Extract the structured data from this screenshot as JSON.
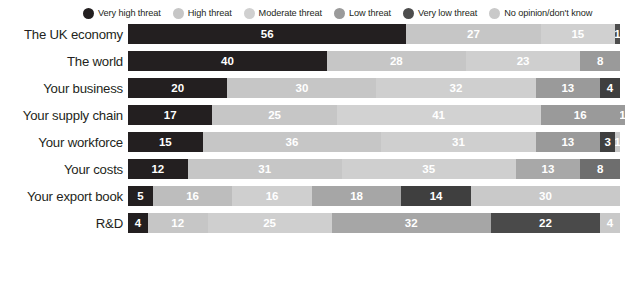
{
  "legend": {
    "items": [
      {
        "label": "Very high threat",
        "color": "#231f20",
        "swatch_icon": "legend-dot-icon"
      },
      {
        "label": "High threat",
        "color": "#c6c6c6",
        "swatch_icon": "legend-dot-icon"
      },
      {
        "label": "Moderate threat",
        "color": "#d0d0d0",
        "swatch_icon": "legend-dot-icon"
      },
      {
        "label": "Low threat",
        "color": "#9a9a9a",
        "swatch_icon": "legend-dot-icon"
      },
      {
        "label": "Very low threat",
        "color": "#4d4d4d",
        "swatch_icon": "legend-dot-icon"
      },
      {
        "label": "No opinion/don't know",
        "color": "#c9c9c9",
        "swatch_icon": "legend-dot-icon"
      }
    ]
  },
  "chart_data": {
    "type": "bar",
    "orientation": "horizontal",
    "stacked": true,
    "title": "",
    "subtitle": "",
    "xlabel": "",
    "ylabel": "",
    "xlim": [
      0,
      100
    ],
    "grid": false,
    "legend_position": "top",
    "value_suffix": "",
    "categories": [
      "The UK economy",
      "The world",
      "Your business",
      "Your supply chain",
      "Your workforce",
      "Your costs",
      "Your export book",
      "R&D"
    ],
    "series": [
      {
        "name": "Very high threat",
        "color": "#231f20",
        "label_color": "#ffffff",
        "values": [
          56,
          40,
          20,
          17,
          15,
          12,
          5,
          4
        ]
      },
      {
        "name": "High threat",
        "color": "#c6c6c6",
        "label_color": "#ffffff",
        "values": [
          27,
          28,
          30,
          25,
          36,
          31,
          16,
          12
        ]
      },
      {
        "name": "Moderate threat",
        "color": "#d0d0d0",
        "label_color": "#ffffff",
        "values": [
          15,
          23,
          32,
          41,
          31,
          35,
          16,
          25
        ]
      },
      {
        "name": "Low threat",
        "color": "#9a9a9a",
        "label_color": "#ffffff",
        "values": [
          1,
          8,
          13,
          16,
          13,
          13,
          18,
          32
        ]
      },
      {
        "name": "Very low threat",
        "color": "#4d4d4d",
        "label_color": "#ffffff",
        "values": [
          0,
          0,
          4,
          1,
          3,
          8,
          14,
          22
        ]
      },
      {
        "name": "No opinion/don't know",
        "color": "#c9c9c9",
        "label_color": "#ffffff",
        "values": [
          0,
          0,
          0,
          0,
          1,
          0,
          30,
          4
        ]
      }
    ],
    "rows": [
      {
        "category": "The UK economy",
        "segments": [
          {
            "series": "Very high threat",
            "value": 56,
            "label": "56",
            "color": "#231f20",
            "label_color": "#ffffff"
          },
          {
            "series": "High threat",
            "value": 27,
            "label": "27",
            "color": "#c6c6c6",
            "label_color": "#ffffff"
          },
          {
            "series": "Moderate threat",
            "value": 15,
            "label": "15",
            "color": "#d0d0d0",
            "label_color": "#ffffff"
          },
          {
            "series": "Low threat",
            "value": 1,
            "label": "1",
            "color": "#4d4d4d",
            "label_color": "#ffffff"
          }
        ]
      },
      {
        "category": "The world",
        "segments": [
          {
            "series": "Very high threat",
            "value": 40,
            "label": "40",
            "color": "#231f20",
            "label_color": "#ffffff"
          },
          {
            "series": "High threat",
            "value": 28,
            "label": "28",
            "color": "#c6c6c6",
            "label_color": "#ffffff"
          },
          {
            "series": "Moderate threat",
            "value": 23,
            "label": "23",
            "color": "#cfcfcf",
            "label_color": "#ffffff"
          },
          {
            "series": "Low threat",
            "value": 8,
            "label": "8",
            "color": "#9a9a9a",
            "label_color": "#ffffff"
          }
        ]
      },
      {
        "category": "Your business",
        "segments": [
          {
            "series": "Very high threat",
            "value": 20,
            "label": "20",
            "color": "#231f20",
            "label_color": "#ffffff"
          },
          {
            "series": "High threat",
            "value": 30,
            "label": "30",
            "color": "#c6c6c6",
            "label_color": "#ffffff"
          },
          {
            "series": "Moderate threat",
            "value": 32,
            "label": "32",
            "color": "#cfcfcf",
            "label_color": "#ffffff"
          },
          {
            "series": "Low threat",
            "value": 13,
            "label": "13",
            "color": "#9a9a9a",
            "label_color": "#ffffff"
          },
          {
            "series": "Very low threat",
            "value": 4,
            "label": "4",
            "color": "#3f3f3f",
            "label_color": "#ffffff"
          }
        ]
      },
      {
        "category": "Your supply chain",
        "segments": [
          {
            "series": "Very high threat",
            "value": 17,
            "label": "17",
            "color": "#231f20",
            "label_color": "#ffffff"
          },
          {
            "series": "High threat",
            "value": 25,
            "label": "25",
            "color": "#c6c6c6",
            "label_color": "#ffffff"
          },
          {
            "series": "Moderate threat",
            "value": 41,
            "label": "41",
            "color": "#d2d2d2",
            "label_color": "#ffffff"
          },
          {
            "series": "Low threat",
            "value": 16,
            "label": "16",
            "color": "#9a9a9a",
            "label_color": "#ffffff"
          },
          {
            "series": "Very low threat",
            "value": 1,
            "label": "1",
            "color": "#9a9a9a",
            "label_color": "#ffffff"
          }
        ]
      },
      {
        "category": "Your workforce",
        "segments": [
          {
            "series": "Very high threat",
            "value": 15,
            "label": "15",
            "color": "#231f20",
            "label_color": "#ffffff"
          },
          {
            "series": "High threat",
            "value": 36,
            "label": "36",
            "color": "#c6c6c6",
            "label_color": "#ffffff"
          },
          {
            "series": "Moderate threat",
            "value": 31,
            "label": "31",
            "color": "#cfcfcf",
            "label_color": "#ffffff"
          },
          {
            "series": "Low threat",
            "value": 13,
            "label": "13",
            "color": "#9a9a9a",
            "label_color": "#ffffff"
          },
          {
            "series": "Very low threat",
            "value": 3,
            "label": "3",
            "color": "#3f3f3f",
            "label_color": "#ffffff"
          },
          {
            "series": "No opinion/don't know",
            "value": 1,
            "label": "1",
            "color": "#c9c9c9",
            "label_color": "#ffffff"
          }
        ]
      },
      {
        "category": "Your costs",
        "segments": [
          {
            "series": "Very high threat",
            "value": 12,
            "label": "12",
            "color": "#231f20",
            "label_color": "#ffffff"
          },
          {
            "series": "High threat",
            "value": 31,
            "label": "31",
            "color": "#c6c6c6",
            "label_color": "#ffffff"
          },
          {
            "series": "Moderate threat",
            "value": 35,
            "label": "35",
            "color": "#cfcfcf",
            "label_color": "#ffffff"
          },
          {
            "series": "Low threat",
            "value": 13,
            "label": "13",
            "color": "#a8a8a8",
            "label_color": "#ffffff"
          },
          {
            "series": "Very low threat",
            "value": 8,
            "label": "8",
            "color": "#6e6e6e",
            "label_color": "#ffffff"
          }
        ]
      },
      {
        "category": "Your export book",
        "segments": [
          {
            "series": "Very high threat",
            "value": 5,
            "label": "5",
            "color": "#231f20",
            "label_color": "#ffffff"
          },
          {
            "series": "High threat",
            "value": 16,
            "label": "16",
            "color": "#bdbdbd",
            "label_color": "#ffffff"
          },
          {
            "series": "Moderate threat",
            "value": 16,
            "label": "16",
            "color": "#cfcfcf",
            "label_color": "#ffffff"
          },
          {
            "series": "Low threat",
            "value": 18,
            "label": "18",
            "color": "#a6a6a6",
            "label_color": "#ffffff"
          },
          {
            "series": "Very low threat",
            "value": 14,
            "label": "14",
            "color": "#3f3f3f",
            "label_color": "#ffffff"
          },
          {
            "series": "No opinion/don't know",
            "value": 30,
            "label": "30",
            "color": "#c9c9c9",
            "label_color": "#ffffff"
          }
        ]
      },
      {
        "category": "R&D",
        "segments": [
          {
            "series": "Very high threat",
            "value": 4,
            "label": "4",
            "color": "#231f20",
            "label_color": "#ffffff"
          },
          {
            "series": "High threat",
            "value": 12,
            "label": "12",
            "color": "#c6c6c6",
            "label_color": "#ffffff"
          },
          {
            "series": "Moderate threat",
            "value": 25,
            "label": "25",
            "color": "#cfcfcf",
            "label_color": "#ffffff"
          },
          {
            "series": "Low threat",
            "value": 32,
            "label": "32",
            "color": "#a6a6a6",
            "label_color": "#ffffff"
          },
          {
            "series": "Very low threat",
            "value": 22,
            "label": "22",
            "color": "#4a4a4a",
            "label_color": "#ffffff"
          },
          {
            "series": "No opinion/don't know",
            "value": 4,
            "label": "4",
            "color": "#c9c9c9",
            "label_color": "#ffffff"
          }
        ]
      }
    ]
  }
}
